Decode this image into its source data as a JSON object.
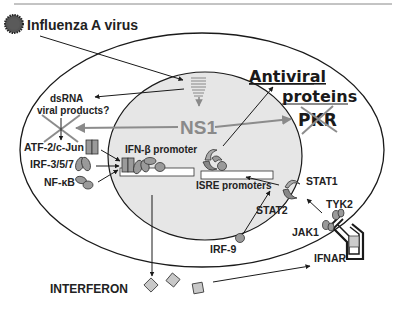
{
  "title": "Influenza A virus",
  "labels": {
    "virus": "Influenza A virus",
    "dsrna_line1": "dsRNA",
    "dsrna_line2": "viral products?",
    "atf2": "ATF-2/c-Jun",
    "irf357": "IRF-3/5/7",
    "nfkb": "NF-κB",
    "ifnb_promoter": "IFN-β promoter",
    "ns1": "NS1",
    "antiviral_line1": "Antiviral",
    "antiviral_line2": "proteins",
    "pkr": "PKR",
    "isre_promoters": "ISRE promoters",
    "stat1": "STAT1",
    "stat2": "STAT2",
    "tyk2": "TYK2",
    "jak1": "JAK1",
    "irf9": "IRF-9",
    "ifnar": "IFNAR",
    "interferon": "INTERFERON"
  },
  "colors": {
    "nucleus_fill": "#e6e6e6",
    "protein_fill": "#9a9a9a",
    "ns1_text": "#8a8a8a",
    "cross": "#8c8c8c",
    "line": "#1a1a1a"
  }
}
